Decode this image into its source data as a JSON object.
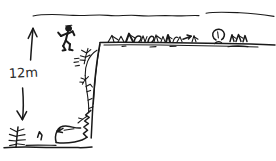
{
  "drawing": {
    "title": "hand-drawn cliff sketch",
    "medium": "ink on white paper",
    "background_color": "#ffffff",
    "ink_color": "#1a1a1a",
    "width": 276,
    "height": 161
  },
  "annotations": {
    "height_label": "12m"
  },
  "scene": {
    "elements": [
      {
        "name": "horizon-line",
        "label": "distant horizon"
      },
      {
        "name": "plateau-ground-line",
        "label": "plateau top edge"
      },
      {
        "name": "cliff-face",
        "label": "vertical cliff face"
      },
      {
        "name": "stick-figure",
        "label": "running person"
      },
      {
        "name": "height-arrow-up",
        "label": "upward dimension arrow"
      },
      {
        "name": "height-arrow-down",
        "label": "downward dimension arrow"
      },
      {
        "name": "plateau-vegetation",
        "label": "grass and bushes on plateau"
      },
      {
        "name": "cliff-vegetation",
        "label": "branches on cliff face"
      },
      {
        "name": "base-rocks",
        "label": "rocks at cliff base"
      },
      {
        "name": "base-ground-line",
        "label": "ground line at base"
      },
      {
        "name": "base-shrub",
        "label": "shrub at bottom left"
      },
      {
        "name": "round-bush",
        "label": "round bush on plateau"
      }
    ]
  }
}
